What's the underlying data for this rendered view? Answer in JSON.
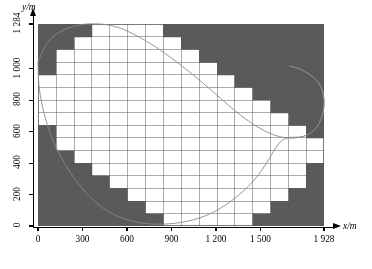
{
  "figure": {
    "background": "#ffffff",
    "cell_fill": "#5a5a5a",
    "cell_fill_inside": "#ffffff",
    "grid_color": "#585858",
    "curve_color": "#8a8a8a",
    "axis_color": "#000000"
  },
  "axes": {
    "y_caption": "y/m",
    "x_caption": "x/m",
    "x_label": "x/m",
    "y_label": "y/m",
    "x_ticks": [
      {
        "value": 0,
        "label": "0"
      },
      {
        "value": 300,
        "label": "300"
      },
      {
        "value": 600,
        "label": "600"
      },
      {
        "value": 900,
        "label": "900"
      },
      {
        "value": 1200,
        "label": "1 200"
      },
      {
        "value": 1500,
        "label": "1 500"
      },
      {
        "value": 1928,
        "label": "1 928"
      }
    ],
    "y_ticks": [
      {
        "value": 0,
        "label": "0"
      },
      {
        "value": 200,
        "label": "200"
      },
      {
        "value": 400,
        "label": "400"
      },
      {
        "value": 600,
        "label": "600"
      },
      {
        "value": 800,
        "label": "800"
      },
      {
        "value": 1000,
        "label": "1 000"
      },
      {
        "value": 1284,
        "label": "1 284"
      }
    ]
  },
  "chart_data": {
    "type": "heatmap",
    "title": "",
    "subtitle": "",
    "xlabel": "x/m",
    "ylabel": "y/m",
    "xlim": [
      0,
      1928
    ],
    "ylim": [
      0,
      1284
    ],
    "grid": true,
    "legend": "none",
    "grid_spec": {
      "n_cols": 16,
      "n_rows": 16,
      "cell_width_m": 120.5,
      "cell_height_m": 80.25,
      "x_edges_m": [
        0,
        120.5,
        241,
        361.5,
        482,
        602.5,
        723,
        843.5,
        964,
        1084.5,
        1205,
        1325.5,
        1446,
        1566.5,
        1687,
        1807.5,
        1928
      ],
      "y_edges_m": [
        0,
        80.25,
        160.5,
        240.75,
        321,
        401.25,
        481.5,
        561.75,
        642,
        722.25,
        802.5,
        882.75,
        963,
        1043.25,
        1123.5,
        1203.75,
        1284
      ]
    },
    "categories": [
      "0",
      "300",
      "600",
      "900",
      "1 200",
      "1 500",
      "1 928"
    ],
    "values": [
      0,
      0,
      0,
      0,
      0,
      0,
      0
    ],
    "legend_entries": [
      {
        "label": "inside domain",
        "value": 0,
        "color": "#ffffff"
      },
      {
        "label": "outside domain (masked)",
        "value": 1,
        "color": "#5a5a5a"
      }
    ],
    "comment": "mask[r][c] = 1 when cell is shaded dark (outside the closed boundary curve); row 0 is the TOP row (y near 1284), column 0 is the LEFT column (x near 0).",
    "mask": [
      [
        1,
        1,
        1,
        0,
        0,
        0,
        0,
        1,
        1,
        1,
        1,
        1,
        1,
        1,
        1,
        1
      ],
      [
        1,
        1,
        0,
        0,
        0,
        0,
        0,
        0,
        1,
        1,
        1,
        1,
        1,
        1,
        1,
        1
      ],
      [
        1,
        0,
        0,
        0,
        0,
        0,
        0,
        0,
        0,
        1,
        1,
        1,
        1,
        1,
        1,
        1
      ],
      [
        1,
        0,
        0,
        0,
        0,
        0,
        0,
        0,
        0,
        0,
        1,
        1,
        1,
        1,
        1,
        1
      ],
      [
        0,
        0,
        0,
        0,
        0,
        0,
        0,
        0,
        0,
        0,
        0,
        1,
        1,
        1,
        1,
        1
      ],
      [
        0,
        0,
        0,
        0,
        0,
        0,
        0,
        0,
        0,
        0,
        0,
        0,
        1,
        1,
        1,
        1
      ],
      [
        0,
        0,
        0,
        0,
        0,
        0,
        0,
        0,
        0,
        0,
        0,
        0,
        0,
        1,
        1,
        1
      ],
      [
        0,
        0,
        0,
        0,
        0,
        0,
        0,
        0,
        0,
        0,
        0,
        0,
        0,
        0,
        1,
        1
      ],
      [
        1,
        0,
        0,
        0,
        0,
        0,
        0,
        0,
        0,
        0,
        0,
        0,
        0,
        0,
        0,
        1
      ],
      [
        1,
        0,
        0,
        0,
        0,
        0,
        0,
        0,
        0,
        0,
        0,
        0,
        0,
        0,
        0,
        0
      ],
      [
        1,
        1,
        0,
        0,
        0,
        0,
        0,
        0,
        0,
        0,
        0,
        0,
        0,
        0,
        0,
        0
      ],
      [
        1,
        1,
        1,
        0,
        0,
        0,
        0,
        0,
        0,
        0,
        0,
        0,
        0,
        0,
        0,
        1
      ],
      [
        1,
        1,
        1,
        1,
        0,
        0,
        0,
        0,
        0,
        0,
        0,
        0,
        0,
        0,
        0,
        1
      ],
      [
        1,
        1,
        1,
        1,
        1,
        0,
        0,
        0,
        0,
        0,
        0,
        0,
        0,
        0,
        1,
        1
      ],
      [
        1,
        1,
        1,
        1,
        1,
        1,
        0,
        0,
        0,
        0,
        0,
        0,
        0,
        1,
        1,
        1
      ],
      [
        1,
        1,
        1,
        1,
        1,
        1,
        1,
        0,
        0,
        0,
        0,
        0,
        1,
        1,
        1,
        1
      ]
    ],
    "boundary_curve": {
      "name": "domain boundary",
      "closed": true,
      "points_m": [
        [
          0,
          1043
        ],
        [
          60,
          1160
        ],
        [
          150,
          1235
        ],
        [
          280,
          1278
        ],
        [
          420,
          1284
        ],
        [
          540,
          1262
        ],
        [
          660,
          1212
        ],
        [
          790,
          1140
        ],
        [
          910,
          1060
        ],
        [
          1040,
          965
        ],
        [
          1170,
          862
        ],
        [
          1300,
          755
        ],
        [
          1430,
          660
        ],
        [
          1560,
          590
        ],
        [
          1680,
          560
        ],
        [
          1790,
          570
        ],
        [
          1872,
          620
        ],
        [
          1915,
          700
        ],
        [
          1928,
          790
        ],
        [
          1910,
          880
        ],
        [
          1850,
          950
        ],
        [
          1760,
          1000
        ],
        [
          1700,
          1015
        ],
        [
          1700,
          1015
        ],
        [
          1760,
          1000
        ],
        [
          1850,
          950
        ],
        [
          1910,
          880
        ],
        [
          1928,
          790
        ],
        [
          1915,
          700
        ],
        [
          1872,
          620
        ],
        [
          1790,
          570
        ],
        [
          1680,
          560
        ],
        [
          1620,
          520
        ],
        [
          1560,
          430
        ],
        [
          1490,
          330
        ],
        [
          1400,
          235
        ],
        [
          1290,
          150
        ],
        [
          1170,
          82
        ],
        [
          1040,
          38
        ],
        [
          910,
          16
        ],
        [
          780,
          12
        ],
        [
          660,
          26
        ],
        [
          540,
          60
        ],
        [
          430,
          120
        ],
        [
          330,
          205
        ],
        [
          240,
          310
        ],
        [
          160,
          430
        ],
        [
          90,
          570
        ],
        [
          40,
          720
        ],
        [
          8,
          880
        ],
        [
          0,
          1043
        ]
      ]
    }
  }
}
